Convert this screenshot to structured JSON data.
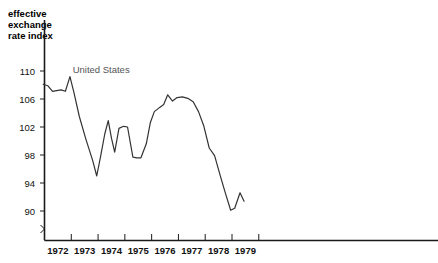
{
  "chart_data": {
    "type": "line",
    "title": "",
    "axis_title": "effective\nexchange\nrate index",
    "axis_title_lines": [
      "effective",
      "exchange",
      "rate index"
    ],
    "xlabel": "",
    "ylabel": "effective exchange rate index",
    "ylim": [
      88,
      111.5
    ],
    "yticks": [
      110,
      106,
      102,
      98,
      94,
      90
    ],
    "ytick_labels": [
      "110",
      "106",
      "102",
      "98",
      "94",
      "90"
    ],
    "xlim": [
      1971.75,
      1979.6
    ],
    "xticks": [
      1972,
      1973,
      1974,
      1975,
      1976,
      1977,
      1978,
      1979,
      1980
    ],
    "xtick_labels": [
      "1972",
      "1973",
      "1974",
      "1975",
      "1976",
      "1977",
      "1978",
      "1979"
    ],
    "xtick_label_positions": [
      1972.5,
      1973.5,
      1974.5,
      1975.5,
      1976.5,
      1977.5,
      1978.5,
      1979.5
    ],
    "grid": false,
    "axis_break": true,
    "legend_position": "inline-label",
    "line_color": "#333333",
    "label_color": "#555555",
    "series": [
      {
        "name": "United States",
        "label_x": 1973.05,
        "label_y": 110.0,
        "x": [
          1971.95,
          1972.12,
          1972.3,
          1972.45,
          1972.62,
          1972.78,
          1972.95,
          1973.1,
          1973.3,
          1973.55,
          1973.8,
          1973.95,
          1974.1,
          1974.25,
          1974.38,
          1974.5,
          1974.62,
          1974.78,
          1974.95,
          1975.1,
          1975.3,
          1975.45,
          1975.6,
          1975.8,
          1975.95,
          1976.1,
          1976.3,
          1976.45,
          1976.6,
          1976.78,
          1976.95,
          1977.15,
          1977.35,
          1977.55,
          1977.75,
          1977.95,
          1978.15,
          1978.35,
          1978.55,
          1978.75,
          1978.95,
          1979.1,
          1979.3,
          1979.45
        ],
        "y": [
          108.1,
          107.9,
          107.1,
          107.2,
          107.3,
          107.1,
          109.2,
          106.9,
          103.5,
          100.2,
          97.2,
          95.0,
          97.9,
          101.0,
          102.9,
          100.4,
          98.4,
          101.8,
          102.1,
          102.0,
          97.7,
          97.6,
          97.6,
          99.6,
          102.6,
          104.2,
          104.8,
          105.2,
          106.6,
          105.7,
          106.2,
          106.3,
          106.1,
          105.6,
          104.2,
          102.1,
          99.0,
          97.9,
          95.2,
          92.6,
          90.1,
          90.4,
          92.6,
          91.4
        ]
      }
    ]
  }
}
